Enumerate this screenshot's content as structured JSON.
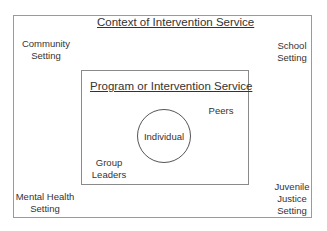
{
  "diagram": {
    "outer": {
      "title": "Context of Intervention Service",
      "settings": {
        "community": [
          "Community",
          "Setting"
        ],
        "school": [
          "School",
          "Setting"
        ],
        "mental_health": [
          "Mental Health",
          "Setting"
        ],
        "juvenile_justice": [
          "Juvenile",
          "Justice",
          "Setting"
        ]
      }
    },
    "inner": {
      "title": "Program or Intervention Service",
      "peers": "Peers",
      "group_leaders": [
        "Group",
        "Leaders"
      ],
      "center": "Individual"
    }
  }
}
